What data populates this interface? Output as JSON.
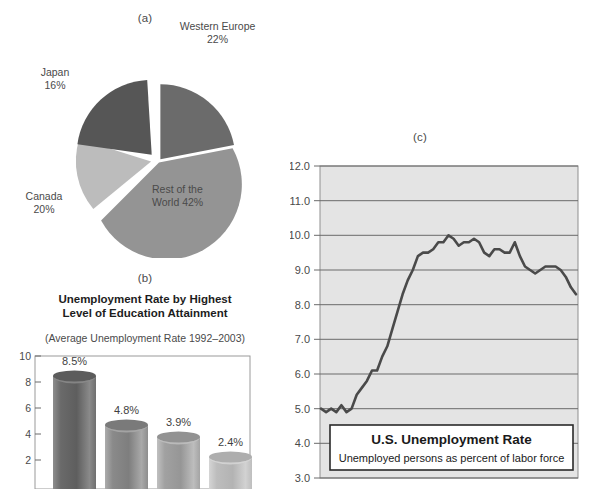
{
  "panels": {
    "a": {
      "caption": "(a)"
    },
    "b": {
      "caption": "(b)"
    },
    "c": {
      "caption": "(c)"
    }
  },
  "pie": {
    "labels": {
      "western_europe": "Western Europe\n22%",
      "western_europe_name": "Western Europe",
      "western_europe_pct": "22%",
      "japan_name": "Japan",
      "japan_pct": "16%",
      "canada_name": "Canada",
      "canada_pct": "20%",
      "row_line1": "Rest of the",
      "row_line2": "World 42%"
    }
  },
  "bar": {
    "title_line1": "Unemployment Rate by Highest",
    "title_line2": "Level of Education Attainment",
    "subtitle": "(Average Unemployment Rate 1992–2003)"
  },
  "line": {
    "callout_title": "U.S. Unemployment Rate",
    "callout_sub": "Unemployed persons as percent of labor force"
  },
  "colors": {
    "western_europe": "#6b6b6b",
    "japan": "#565656",
    "canada": "#bcbcbc",
    "rest_of_world": "#949494",
    "bar_dark": "#6d6d6d",
    "bar_mid": "#8f8f8f",
    "bar_light": "#a8a8a8",
    "bar_lighter": "#c2c2c2",
    "plot_bg": "#e4e4e4",
    "gridline": "#6a6a6a",
    "line_stroke": "#4a4a4a"
  },
  "chart_data": [
    {
      "type": "pie",
      "title": "(a)",
      "categories": [
        "Western Europe",
        "Rest of the World",
        "Canada",
        "Japan"
      ],
      "values": [
        22,
        42,
        20,
        16
      ],
      "labels": [
        "Western Europe 22%",
        "Rest of the World 42%",
        "Canada 20%",
        "Japan 16%"
      ],
      "unit": "percent",
      "exploded": true,
      "legend": "none",
      "colors": [
        "#6b6b6b",
        "#949494",
        "#bcbcbc",
        "#565656"
      ]
    },
    {
      "type": "bar",
      "title": "Unemployment Rate by Highest Level of Education Attainment",
      "subtitle": "(Average Unemployment Rate 1992–2003)",
      "categories": [
        "",
        "",
        "",
        ""
      ],
      "values": [
        8.5,
        4.8,
        3.9,
        2.4
      ],
      "data_labels": [
        "8.5%",
        "4.8%",
        "3.9%",
        "2.4%"
      ],
      "xlabel": "",
      "ylabel": "",
      "ylim": [
        0,
        10
      ],
      "yticks": [
        2,
        4,
        6,
        8,
        10
      ],
      "ytick_labels": [
        "2",
        "4",
        "6",
        "8",
        "10"
      ],
      "grid": false,
      "legend": "none"
    },
    {
      "type": "line",
      "title": "(c)",
      "annotation_title": "U.S. Unemployment Rate",
      "annotation_sub": "Unemployed persons as percent of labor force",
      "xlabel": "",
      "ylabel": "",
      "ylim": [
        3.0,
        12.0
      ],
      "yticks": [
        3.0,
        4.0,
        5.0,
        6.0,
        7.0,
        8.0,
        9.0,
        10.0,
        11.0,
        12.0
      ],
      "ytick_labels": [
        "3.0",
        "4.0",
        "5.0",
        "6.0",
        "7.0",
        "8.0",
        "9.0",
        "10.0",
        "11.0",
        "12.0"
      ],
      "grid": true,
      "legend": "none",
      "x": [
        0,
        1,
        2,
        3,
        4,
        5,
        6,
        7,
        8,
        9,
        10,
        11,
        12,
        13,
        14,
        15,
        16,
        17,
        18,
        19,
        20,
        21,
        22,
        23,
        24,
        25,
        26,
        27,
        28,
        29,
        30,
        31,
        32,
        33,
        34,
        35,
        36,
        37,
        38,
        39,
        40,
        41,
        42,
        43,
        44,
        45,
        46,
        47,
        48,
        49,
        50,
        51,
        52,
        53,
        54,
        55,
        56
      ],
      "values": [
        5.0,
        4.9,
        5.0,
        4.9,
        5.1,
        4.9,
        5.0,
        5.4,
        5.6,
        5.8,
        6.1,
        6.1,
        6.5,
        6.8,
        7.3,
        7.8,
        8.3,
        8.7,
        9.0,
        9.4,
        9.5,
        9.5,
        9.6,
        9.8,
        9.8,
        10.0,
        9.9,
        9.7,
        9.8,
        9.8,
        9.9,
        9.8,
        9.5,
        9.4,
        9.6,
        9.6,
        9.5,
        9.5,
        9.8,
        9.4,
        9.1,
        9.0,
        8.9,
        9.0,
        9.1,
        9.1,
        9.1,
        9.0,
        8.8,
        8.5,
        8.3
      ]
    }
  ]
}
